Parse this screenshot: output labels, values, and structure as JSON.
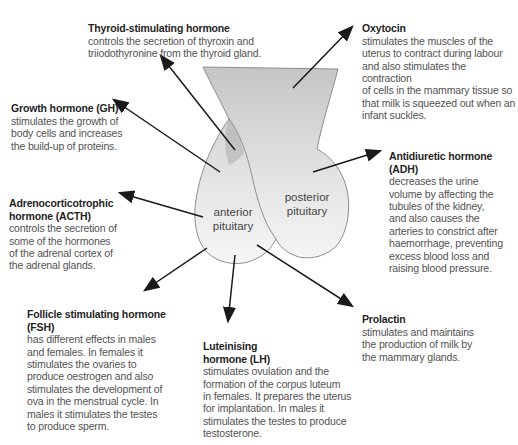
{
  "diagram": {
    "title_hint": "Pituitary gland hormones diagram",
    "gland_labels": {
      "anterior": "anterior\npituitary",
      "posterior": "posterior\npituitary"
    },
    "annotations": [
      {
        "id": "tsh",
        "title": "Thyroid-stimulating hormone",
        "body": "controls the secretion of thyroxin and\ntriiodothyronine from the thyroid gland."
      },
      {
        "id": "oxytocin",
        "title": "Oxytocin",
        "body": "stimulates the muscles of the\nuterus to contract during labour\nand also stimulates the contraction\nof cells in the mammary tissue so\nthat milk is squeezed out when an\ninfant suckles."
      },
      {
        "id": "gh",
        "title": "Growth hormone (GH)",
        "body": "stimulates the growth of\nbody cells and increases\nthe build-up of proteins."
      },
      {
        "id": "acth",
        "title": "Adrenocorticotrophic\nhormone (ACTH)",
        "body": "controls the secretion of\nsome of the hormones\nof the adrenal cortex of\nthe adrenal glands."
      },
      {
        "id": "adh",
        "title": "Antidiuretic hormone\n(ADH)",
        "body": "decreases the urine\nvolume by affecting the\ntubules of the kidney,\nand also causes the\narteries to constrict after\nhaemorrhage, preventing\nexcess blood loss and\nraising blood pressure."
      },
      {
        "id": "fsh",
        "title": "Follicle stimulating hormone\n(FSH)",
        "body": "has different effects in males\nand females. In females it\nstimulates the ovaries to\nproduce oestrogen and also\nstimulates the development of\nova in the menstrual cycle. In\nmales it stimulates the testes\nto produce sperm."
      },
      {
        "id": "lh",
        "title": "Luteinising\nhormone (LH)",
        "body": "stimulates ovulation and the\nformation of the corpus luteum\nin females. It prepares the uterus\nfor implantation. In males it\nstimulates the testes to produce\ntestosterone."
      },
      {
        "id": "prolactin",
        "title": "Prolactin",
        "body": "stimulates and maintains\nthe production of milk by\nthe mammary glands."
      }
    ],
    "colors": {
      "background": "#ffffff",
      "gland_top": "#c5c5c5",
      "gland_mid": "#e3e3e3",
      "gland_bottom": "#f6f6f6",
      "outline": "#8e8e8e",
      "arrow": "#1a1a1a",
      "title_text": "#1f1f1f",
      "body_text": "#525252",
      "label_text": "#454545"
    }
  }
}
